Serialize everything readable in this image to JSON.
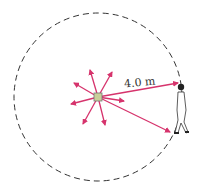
{
  "diagram": {
    "distance_label": "4.0 m",
    "colors": {
      "arrows": "#d6336c",
      "circle": "#333333",
      "source": "#c9cf9a",
      "person": "#222222"
    },
    "elements": {
      "source": "point-source",
      "circle": "dashed-circle-radius",
      "observer": "person-standing-on-circle"
    }
  }
}
